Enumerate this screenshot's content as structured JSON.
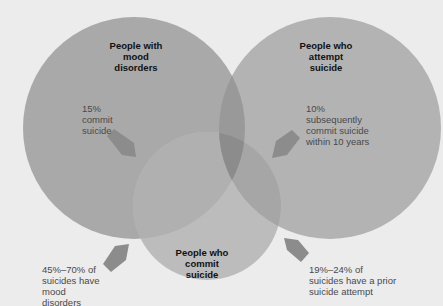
{
  "colors": {
    "background": "#ececec",
    "circle_fill": "#a9a9a9",
    "circle_bottom_fill": "#b8b8b8",
    "overlap_dark": "#8c8c8c",
    "arrow_fill": "#8a8a8a",
    "title_text": "#111111",
    "note_text": "#4a4a4a"
  },
  "circles": {
    "mood_disorders": {
      "title": "People with\nmood\ndisorders",
      "note": "15%\ncommit\nsuicide"
    },
    "attempt_suicide": {
      "title": "People who\nattempt\nsuicide",
      "note": "10%\nsubsequently\ncommit suicide\nwithin 10 years"
    },
    "commit_suicide": {
      "title": "People who\ncommit\nsuicide"
    }
  },
  "outside_notes": {
    "bottom_left": "45%–70% of\nsuicides have\nmood\ndisorders",
    "bottom_right": "19%–24% of\nsuicides have a prior\nsuicide attempt"
  },
  "icons": {
    "arrow_shape": "pentagon-arrow"
  }
}
